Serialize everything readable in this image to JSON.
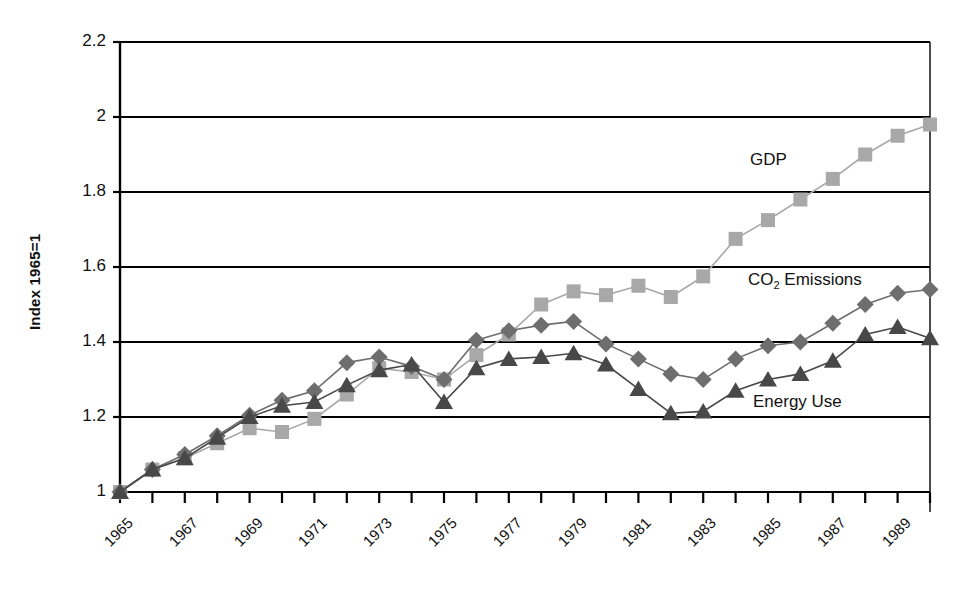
{
  "chart_data": {
    "type": "line",
    "title": "",
    "xlabel": "",
    "ylabel": "Index 1965=1",
    "ylim": [
      1,
      2.2
    ],
    "xlim": [
      1965,
      1990
    ],
    "grid": true,
    "legend_position": "inline-annotations",
    "ytick_labels": [
      "2.2",
      "2",
      "1.8",
      "1.6",
      "1.4",
      "1.2",
      "1"
    ],
    "ytick_values": [
      2.2,
      2.0,
      1.8,
      1.6,
      1.4,
      1.2,
      1.0
    ],
    "x": [
      1965,
      1966,
      1967,
      1968,
      1969,
      1970,
      1971,
      1972,
      1973,
      1974,
      1975,
      1976,
      1977,
      1978,
      1979,
      1980,
      1981,
      1982,
      1983,
      1984,
      1985,
      1986,
      1987,
      1988,
      1989,
      1990
    ],
    "xtick_labels": [
      "1965",
      "1967",
      "1969",
      "1971",
      "1973",
      "1975",
      "1977",
      "1979",
      "1981",
      "1983",
      "1985",
      "1987",
      "1989"
    ],
    "xtick_values": [
      1965,
      1967,
      1969,
      1971,
      1973,
      1975,
      1977,
      1979,
      1981,
      1983,
      1985,
      1987,
      1989
    ],
    "series": [
      {
        "name": "GDP",
        "marker": "square",
        "color": "#a8a8a8",
        "label_x": 1989,
        "values": [
          1.0,
          1.06,
          1.09,
          1.13,
          1.17,
          1.16,
          1.195,
          1.26,
          1.33,
          1.32,
          1.3,
          1.365,
          1.42,
          1.5,
          1.535,
          1.525,
          1.55,
          1.52,
          1.575,
          1.675,
          1.725,
          1.78,
          1.835,
          1.9,
          1.95,
          1.98
        ]
      },
      {
        "name": "CO2 Emissions",
        "marker": "diamond",
        "color": "#6e6e6e",
        "label_x": 1989,
        "values": [
          1.0,
          1.06,
          1.1,
          1.15,
          1.205,
          1.245,
          1.27,
          1.345,
          1.36,
          1.335,
          1.3,
          1.405,
          1.43,
          1.445,
          1.455,
          1.395,
          1.355,
          1.315,
          1.3,
          1.355,
          1.39,
          1.4,
          1.45,
          1.5,
          1.53,
          1.54
        ]
      },
      {
        "name": "Energy Use",
        "marker": "triangle",
        "color": "#484848",
        "label_x": 1989,
        "values": [
          1.0,
          1.06,
          1.09,
          1.145,
          1.2,
          1.23,
          1.24,
          1.285,
          1.325,
          1.34,
          1.24,
          1.33,
          1.355,
          1.36,
          1.37,
          1.34,
          1.275,
          1.21,
          1.215,
          1.27,
          1.3,
          1.315,
          1.35,
          1.42,
          1.44,
          1.41
        ]
      }
    ],
    "annotations": [
      {
        "text": "GDP",
        "x": 750,
        "y": 150
      },
      {
        "text": "CO2 Emissions",
        "x": 748,
        "y": 270,
        "subscript": "2"
      },
      {
        "text": "Energy Use",
        "x": 753,
        "y": 392
      }
    ]
  }
}
